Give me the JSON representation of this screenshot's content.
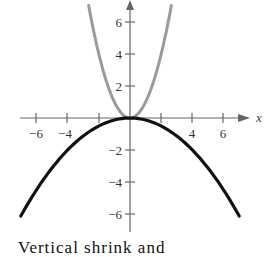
{
  "chart_data": {
    "type": "line",
    "title": "",
    "xlabel": "x",
    "ylabel": "",
    "xlim": [
      -7,
      7.5
    ],
    "ylim": [
      -7,
      7.5
    ],
    "grid": false,
    "x_ticks": [
      -6,
      -4,
      -2,
      2,
      4,
      6
    ],
    "x_tick_labels": [
      "-6",
      "-4",
      "",
      "",
      "4",
      "6"
    ],
    "y_ticks": [
      6,
      4,
      2,
      -2,
      -4,
      -6
    ],
    "y_tick_labels": [
      "6",
      "4",
      "2",
      "−2",
      "−4",
      "−6"
    ],
    "series": [
      {
        "name": "y = x^2",
        "color": "#9a9a9a",
        "x": [
          -2.65,
          -2,
          -1.5,
          -1,
          -0.5,
          0,
          0.5,
          1,
          1.5,
          2,
          2.65
        ],
        "values": [
          7.02,
          4,
          2.25,
          1,
          0.25,
          0,
          0.25,
          1,
          2.25,
          4,
          7.02
        ]
      },
      {
        "name": "y = -x^2/8",
        "color": "#111111",
        "x": [
          -7,
          -6,
          -4,
          -2,
          0,
          2,
          4,
          6,
          7
        ],
        "values": [
          -6.125,
          -4.5,
          -2,
          -0.5,
          0,
          -0.5,
          -2,
          -4.5,
          -6.125
        ]
      }
    ]
  },
  "labels": {
    "x_axis": "x",
    "xt_m6": "−6",
    "xt_m4": "−4",
    "xt_4": "4",
    "xt_6": "6",
    "yt_6": "6",
    "yt_4": "4",
    "yt_2": "2",
    "yt_m2": "−2",
    "yt_m4": "−4",
    "yt_m6": "−6"
  },
  "caption": "Vertical shrink and"
}
